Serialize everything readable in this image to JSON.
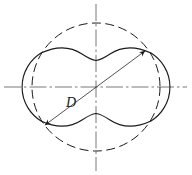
{
  "figure": {
    "kind": "engineering-line-drawing",
    "canvas": {
      "width": 192,
      "height": 175
    },
    "colors": {
      "line": "#1a1a1a",
      "centerline": "#555555",
      "background": "#ffffff"
    },
    "labels": [
      {
        "id": "diameter-label",
        "text": "D",
        "style": "italic",
        "x": 67,
        "y": 102,
        "font_size": 13
      }
    ],
    "center": {
      "x": 96,
      "y": 87
    },
    "reference_circle": {
      "name": "pitch-circle",
      "style": "dashed",
      "cx": 96,
      "cy": 87,
      "r": 64,
      "dash": "9,4"
    },
    "rotor_outline": {
      "name": "rotor-profile",
      "style": "solid",
      "left_lobe_center": {
        "x": 53,
        "y": 87
      },
      "right_lobe_center": {
        "x": 139,
        "y": 87
      },
      "lobe_radius": 40,
      "waist_top_y": 58,
      "waist_bottom_y": 117,
      "extent_left_x": 13,
      "extent_right_x": 179,
      "extent_top_y": 47,
      "extent_bottom_y": 128
    },
    "dimension_line": {
      "name": "diameter-dimension",
      "style": "thin-solid-with-arrows",
      "from": {
        "x": 44,
        "y": 126
      },
      "to": {
        "x": 146,
        "y": 50
      },
      "arrowheads": "both"
    },
    "centerlines": [
      {
        "id": "horizontal-centerline",
        "orientation": "horizontal",
        "x1": 4,
        "y1": 87,
        "x2": 187,
        "y2": 87,
        "dash": "16,3,2,3"
      },
      {
        "id": "vertical-centerline",
        "orientation": "vertical",
        "x1": 96,
        "y1": 4,
        "x2": 96,
        "y2": 171,
        "dash": "16,3,2,3"
      }
    ]
  }
}
